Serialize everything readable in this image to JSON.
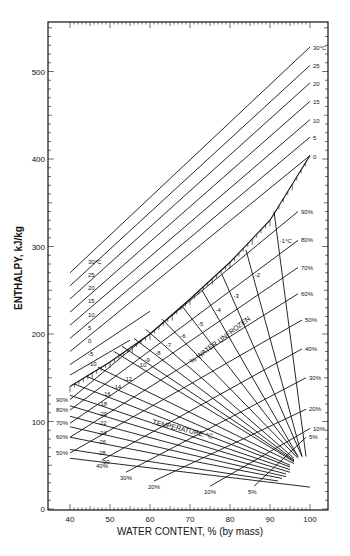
{
  "chart_data": {
    "type": "line",
    "title": "",
    "xlabel": "WATER CONTENT, % (by mass)",
    "ylabel": "ENTHALPY, kJ/kg",
    "xlim": [
      35,
      105
    ],
    "ylim": [
      0,
      560
    ],
    "x_ticks": [
      40,
      50,
      60,
      70,
      80,
      90,
      100
    ],
    "y_ticks": [
      0,
      100,
      200,
      300,
      400,
      500
    ],
    "grid": false,
    "annotations": [
      "TEMPERATURE °C",
      "% WATER UNFROZEN"
    ],
    "temperature_lines_unfrozen": [
      {
        "name": "30°C",
        "label": "30°C",
        "points": [
          [
            40,
            270
          ],
          [
            100,
            528
          ]
        ]
      },
      {
        "name": "25",
        "label": "25",
        "points": [
          [
            40,
            255
          ],
          [
            100,
            507
          ]
        ]
      },
      {
        "name": "20",
        "label": "20",
        "points": [
          [
            40,
            240
          ],
          [
            100,
            487
          ]
        ]
      },
      {
        "name": "15",
        "label": "15",
        "points": [
          [
            40,
            225
          ],
          [
            100,
            466
          ]
        ]
      },
      {
        "name": "10",
        "label": "10",
        "points": [
          [
            40,
            210
          ],
          [
            100,
            445
          ]
        ]
      },
      {
        "name": "5",
        "label": "5",
        "points": [
          [
            40,
            195
          ],
          [
            100,
            425
          ]
        ]
      },
      {
        "name": "0",
        "label": "0",
        "points": [
          [
            40,
            180
          ],
          [
            100,
            404
          ]
        ]
      },
      {
        "name": "-5",
        "label": "-5",
        "points": [
          [
            40,
            165
          ],
          [
            60,
            226
          ]
        ]
      },
      {
        "name": "-10",
        "label": "-10",
        "points": [
          [
            40,
            153
          ],
          [
            55,
            193
          ]
        ]
      }
    ],
    "freezing_curve": {
      "name": "initial freezing",
      "points": [
        [
          40,
          140
        ],
        [
          50,
          168
        ],
        [
          60,
          200
        ],
        [
          70,
          240
        ],
        [
          80,
          282
        ],
        [
          90,
          330
        ],
        [
          100,
          404
        ]
      ]
    },
    "temperature_lines_frozen": [
      {
        "name": "-1°C",
        "label": "-1°C",
        "points": [
          [
            91,
            340
          ],
          [
            99,
            60
          ]
        ]
      },
      {
        "name": "-2",
        "label": "-2",
        "points": [
          [
            84,
            296
          ],
          [
            98,
            60
          ]
        ]
      },
      {
        "name": "-3",
        "label": "-3",
        "points": [
          [
            78,
            268
          ],
          [
            98,
            60
          ]
        ]
      },
      {
        "name": "-4",
        "label": "-4",
        "points": [
          [
            73,
            250
          ],
          [
            97,
            60
          ]
        ]
      },
      {
        "name": "-5",
        "label": "-5",
        "points": [
          [
            68,
            232
          ],
          [
            97,
            60
          ]
        ]
      },
      {
        "name": "-6",
        "label": "-6",
        "points": [
          [
            63,
            217
          ],
          [
            97,
            58
          ]
        ]
      },
      {
        "name": "-7",
        "label": "-7",
        "points": [
          [
            59,
            205
          ],
          [
            96,
            58
          ]
        ]
      },
      {
        "name": "-8",
        "label": "-8",
        "points": [
          [
            56,
            195
          ],
          [
            96,
            56
          ]
        ]
      },
      {
        "name": "-9",
        "label": "-9",
        "points": [
          [
            53,
            186
          ],
          [
            96,
            55
          ]
        ]
      },
      {
        "name": "-10",
        "label": "-10",
        "points": [
          [
            51,
            180
          ],
          [
            96,
            54
          ]
        ]
      },
      {
        "name": "-12",
        "label": "-12",
        "points": [
          [
            47,
            162
          ],
          [
            96,
            52
          ]
        ]
      },
      {
        "name": "-14",
        "label": "-14",
        "points": [
          [
            44,
            152
          ],
          [
            95,
            50
          ]
        ]
      },
      {
        "name": "-16",
        "label": "-16",
        "points": [
          [
            41,
            143
          ],
          [
            95,
            48
          ]
        ]
      },
      {
        "name": "-18",
        "label": "-18",
        "points": [
          [
            40,
            130
          ],
          [
            95,
            45
          ]
        ]
      },
      {
        "name": "-20",
        "label": "-20",
        "points": [
          [
            40,
            118
          ],
          [
            95,
            42
          ]
        ]
      },
      {
        "name": "-22",
        "label": "-22",
        "points": [
          [
            40,
            106
          ],
          [
            94,
            40
          ]
        ]
      },
      {
        "name": "-24",
        "label": "-24",
        "points": [
          [
            40,
            94
          ],
          [
            94,
            37
          ]
        ]
      },
      {
        "name": "-26",
        "label": "-26",
        "points": [
          [
            40,
            82
          ],
          [
            93,
            35
          ]
        ]
      },
      {
        "name": "-28",
        "label": "-28",
        "points": [
          [
            40,
            68
          ],
          [
            92,
            32
          ]
        ]
      },
      {
        "name": "-30",
        "label": "-30",
        "points": [
          [
            40,
            58
          ],
          [
            100,
            25
          ]
        ]
      }
    ],
    "unfrozen_fraction_lines": [
      {
        "name": "90%",
        "label": "90%",
        "points": [
          [
            40,
            125
          ],
          [
            97,
            340
          ]
        ]
      },
      {
        "name": "80%",
        "label": "80%",
        "points": [
          [
            40,
            113
          ],
          [
            97,
            307
          ]
        ]
      },
      {
        "name": "70%",
        "label": "70%",
        "points": [
          [
            40,
            98
          ],
          [
            97,
            276
          ]
        ]
      },
      {
        "name": "60%",
        "label": "60%",
        "points": [
          [
            40,
            82
          ],
          [
            97,
            246
          ]
        ]
      },
      {
        "name": "50%",
        "label": "50%",
        "points": [
          [
            40,
            64
          ],
          [
            98,
            216
          ]
        ]
      },
      {
        "name": "40%",
        "label": "40%",
        "points": [
          [
            48,
            56
          ],
          [
            98,
            183
          ]
        ]
      },
      {
        "name": "30%",
        "label": "30%",
        "points": [
          [
            54,
            42
          ],
          [
            99,
            150
          ]
        ]
      },
      {
        "name": "20%",
        "label": "20%",
        "points": [
          [
            61,
            32
          ],
          [
            99,
            114
          ]
        ]
      },
      {
        "name": "10%",
        "label": "10%",
        "points": [
          [
            75,
            26
          ],
          [
            100,
            92
          ]
        ]
      },
      {
        "name": "5%",
        "label": "5%",
        "points": [
          [
            86,
            26
          ],
          [
            99,
            82
          ]
        ]
      }
    ]
  },
  "axes": {
    "x_tick_labels": [
      "40",
      "50",
      "60",
      "70",
      "80",
      "90",
      "100"
    ],
    "y_tick_labels": [
      "0",
      "100",
      "200",
      "300",
      "400",
      "500"
    ],
    "xlabel": "WATER CONTENT, % (by mass)",
    "ylabel": "ENTHALPY, kJ/kg"
  },
  "annotations": {
    "temperature": "TEMPERATURE °C",
    "unfrozen": "% WATER UNFROZEN"
  }
}
